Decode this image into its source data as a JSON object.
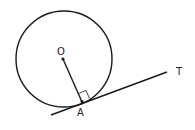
{
  "diagram": {
    "type": "circle-tangent",
    "labels": {
      "center": "O",
      "point_of_tangency": "A",
      "tangent_end": "T"
    },
    "colors": {
      "stroke": "#1a1a1a",
      "background": "#ffffff"
    },
    "elements": [
      "circle",
      "radius OA",
      "tangent line AT",
      "right-angle marker at A"
    ]
  }
}
